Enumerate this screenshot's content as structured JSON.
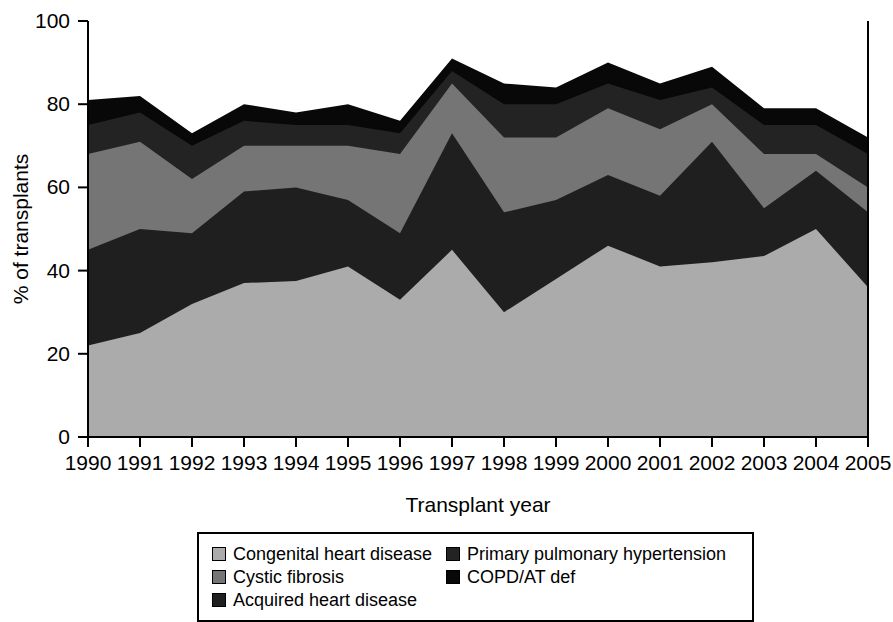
{
  "chart_data": {
    "type": "area",
    "stacked": true,
    "title": "",
    "xlabel": "Transplant year",
    "ylabel": "% of transplants",
    "grid": false,
    "legend_position": "bottom",
    "xlim": [
      1990,
      2005
    ],
    "ylim": [
      0,
      100
    ],
    "xticks": [
      1990,
      1991,
      1992,
      1993,
      1994,
      1995,
      1996,
      1997,
      1998,
      1999,
      2000,
      2001,
      2002,
      2003,
      2004,
      2005
    ],
    "yticks": [
      0,
      20,
      40,
      60,
      80,
      100
    ],
    "categories": [
      "1990",
      "1991",
      "1992",
      "1993",
      "1994",
      "1995",
      "1996",
      "1997",
      "1998",
      "1999",
      "2000",
      "2001",
      "2002",
      "2003",
      "2004",
      "2005"
    ],
    "series": [
      {
        "name": "Congenital heart disease",
        "color": "#ababab",
        "values": [
          22,
          25,
          32,
          37,
          37.5,
          41,
          33,
          45,
          30,
          38,
          46,
          41,
          42,
          43.5,
          50,
          36
        ],
        "cumulative": [
          22,
          25,
          32,
          37,
          37.5,
          41,
          33,
          45,
          30,
          38,
          46,
          41,
          42,
          43.5,
          50,
          36
        ]
      },
      {
        "name": "Acquired heart disease",
        "color": "#1f1f1f",
        "values": [
          23,
          25,
          17,
          22,
          22.5,
          16,
          16,
          28,
          24,
          19,
          17,
          17,
          29,
          11.5,
          14,
          18
        ],
        "cumulative": [
          45,
          50,
          49,
          59,
          60,
          57,
          49,
          73,
          54,
          57,
          63,
          58,
          71,
          55,
          64,
          54
        ]
      },
      {
        "name": "Cystic fibrosis",
        "color": "#757575",
        "values": [
          23,
          21,
          13,
          11,
          10,
          13,
          19,
          12,
          18,
          15,
          16,
          16,
          9,
          13,
          4,
          6
        ],
        "cumulative": [
          68,
          71,
          62,
          70,
          70,
          70,
          68,
          85,
          72,
          72,
          79,
          74,
          80,
          68,
          68,
          60
        ]
      },
      {
        "name": "Primary pulmonary hypertension",
        "color": "#232323",
        "values": [
          7,
          7,
          8,
          6,
          5,
          5,
          5,
          3,
          8,
          8,
          6,
          7,
          4,
          7,
          7,
          8
        ],
        "cumulative": [
          75,
          78,
          70,
          76,
          75,
          75,
          73,
          88,
          80,
          80,
          85,
          81,
          84,
          75,
          75,
          68
        ]
      },
      {
        "name": "COPD/AT def",
        "color": "#080808",
        "values": [
          6,
          4,
          3,
          4,
          3,
          5,
          3,
          3,
          5,
          4,
          5,
          4,
          5,
          4,
          4,
          4
        ],
        "cumulative": [
          81,
          82,
          73,
          80,
          78,
          80,
          76,
          91,
          85,
          84,
          90,
          85,
          89,
          79,
          79,
          72
        ]
      }
    ]
  },
  "axes": {
    "y_label": "% of transplants",
    "x_label": "Transplant year",
    "y_tick_labels": [
      "0",
      "20",
      "40",
      "60",
      "80",
      "100"
    ],
    "x_tick_labels": [
      "1990",
      "1991",
      "1992",
      "1993",
      "1994",
      "1995",
      "1996",
      "1997",
      "1998",
      "1999",
      "2000",
      "2001",
      "2002",
      "2003",
      "2004",
      "2005"
    ]
  },
  "legend": {
    "left_column": [
      {
        "label": "Congenital heart disease",
        "color": "#ababab"
      },
      {
        "label": "Cystic fibrosis",
        "color": "#757575"
      },
      {
        "label": "Acquired heart disease",
        "color": "#1f1f1f"
      }
    ],
    "right_column": [
      {
        "label": "Primary pulmonary hypertension",
        "color": "#232323"
      },
      {
        "label": "COPD/AT def",
        "color": "#080808"
      }
    ]
  }
}
